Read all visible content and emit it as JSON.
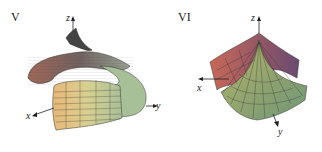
{
  "figure": {
    "panels": [
      {
        "label": "V",
        "surface": "helical tube (spiral)",
        "axes": {
          "x": "x",
          "y": "y",
          "z": "z"
        }
      },
      {
        "label": "VI",
        "surface": "conical fan surface",
        "axes": {
          "x": "x",
          "y": "y",
          "z": "z"
        }
      }
    ]
  }
}
